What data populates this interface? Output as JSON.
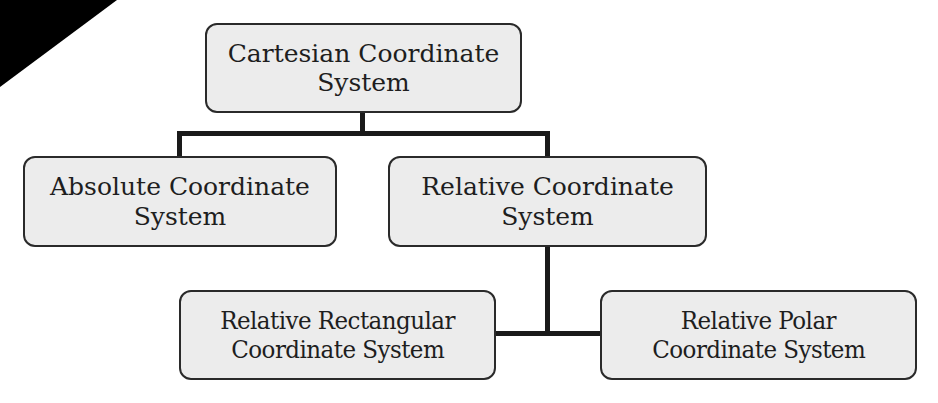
{
  "diagram": {
    "type": "hierarchy",
    "corner_mark": {
      "shape": "triangle",
      "color": "#000000"
    },
    "nodes": {
      "root": {
        "id": "cartesian",
        "lines": [
          "Cartesian Coordinate",
          "System"
        ]
      },
      "absolute": {
        "id": "absolute",
        "parent": "cartesian",
        "lines": [
          "Absolute Coordinate",
          "System"
        ]
      },
      "relative": {
        "id": "relative",
        "parent": "cartesian",
        "lines": [
          "Relative Coordinate",
          "System"
        ]
      },
      "relative_rectangular": {
        "id": "relative_rectangular",
        "parent": "relative",
        "lines": [
          "Relative Rectangular",
          "Coordinate System"
        ]
      },
      "relative_polar": {
        "id": "relative_polar",
        "parent": "relative",
        "lines": [
          "Relative Polar",
          "Coordinate System"
        ]
      }
    },
    "edges": [
      {
        "from": "cartesian",
        "to": "absolute"
      },
      {
        "from": "cartesian",
        "to": "relative"
      },
      {
        "from": "relative",
        "to": "relative_rectangular"
      },
      {
        "from": "relative",
        "to": "relative_polar"
      }
    ],
    "colors": {
      "box_fill": "#ececec",
      "box_border": "#2a2a2a",
      "connector": "#1a1a1a",
      "text": "#1e1e1e"
    }
  }
}
